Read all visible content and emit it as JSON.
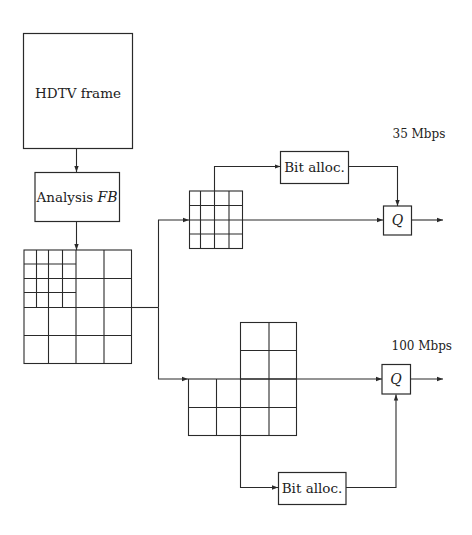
{
  "diagram": {
    "type": "block-diagram",
    "colors": {
      "stroke": "#2a2a2a",
      "text": "#222222",
      "background": "#ffffff"
    },
    "nodes": {
      "hdtv_frame": {
        "label": "HDTV frame"
      },
      "analysis_fb": {
        "label_prefix": "Analysis ",
        "label_math": "FB"
      },
      "subband_decomposition": {
        "label": ""
      },
      "low_band_grid": {
        "label": ""
      },
      "high_band_grid": {
        "label": ""
      },
      "bit_alloc_top": {
        "label": "Bit alloc."
      },
      "bit_alloc_bottom": {
        "label": "Bit alloc."
      },
      "quantizer_top": {
        "label": "Q"
      },
      "quantizer_bottom": {
        "label": "Q"
      }
    },
    "rates": {
      "top": "35 Mbps",
      "bottom": "100 Mbps"
    },
    "edges": [
      {
        "from": "hdtv_frame",
        "to": "analysis_fb"
      },
      {
        "from": "analysis_fb",
        "to": "subband_decomposition"
      },
      {
        "from": "subband_decomposition",
        "to": "low_band_grid"
      },
      {
        "from": "subband_decomposition",
        "to": "high_band_grid"
      },
      {
        "from": "low_band_grid",
        "to": "bit_alloc_top"
      },
      {
        "from": "low_band_grid",
        "to": "quantizer_top"
      },
      {
        "from": "bit_alloc_top",
        "to": "quantizer_top"
      },
      {
        "from": "quantizer_top",
        "to": "output_top"
      },
      {
        "from": "high_band_grid",
        "to": "quantizer_bottom"
      },
      {
        "from": "high_band_grid",
        "to": "bit_alloc_bottom"
      },
      {
        "from": "bit_alloc_bottom",
        "to": "quantizer_bottom"
      },
      {
        "from": "quantizer_bottom",
        "to": "output_bottom"
      }
    ]
  }
}
